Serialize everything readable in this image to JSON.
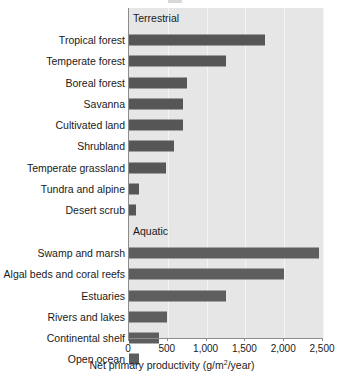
{
  "chart_data": {
    "type": "bar",
    "orientation": "horizontal",
    "title": "",
    "xlabel": "Net primary productivity (g/m2/year)",
    "xlabel_parts": {
      "before": "Net primary productivity (g/m",
      "superscript": "2",
      "after": "/year)"
    },
    "ylabel": "",
    "xlim": [
      0,
      2500
    ],
    "xticks": [
      0,
      500,
      1000,
      1500,
      2000,
      2500
    ],
    "xtick_labels": [
      "0",
      "500",
      "1,000",
      "1,500",
      "2,000",
      "2,500"
    ],
    "grid": true,
    "grid_axis": "x",
    "legend": "none",
    "group_labels": [
      "Terrestrial",
      "Aquatic"
    ],
    "categories": [
      "Tropical forest",
      "Temperate forest",
      "Boreal forest",
      "Savanna",
      "Cultivated land",
      "Shrubland",
      "Temperate grassland",
      "Tundra and alpine",
      "Desert scrub",
      "Swamp and marsh",
      "Algal beds and coral reefs",
      "Estuaries",
      "Rivers and lakes",
      "Continental shelf",
      "Open ocean"
    ],
    "values": [
      1750,
      1250,
      750,
      700,
      700,
      580,
      480,
      130,
      90,
      2450,
      2000,
      1250,
      490,
      390,
      125
    ],
    "groups": [
      "Terrestrial",
      "Terrestrial",
      "Terrestrial",
      "Terrestrial",
      "Terrestrial",
      "Terrestrial",
      "Terrestrial",
      "Terrestrial",
      "Terrestrial",
      "Aquatic",
      "Aquatic",
      "Aquatic",
      "Aquatic",
      "Aquatic",
      "Aquatic"
    ],
    "series": [
      {
        "name": "Net primary productivity",
        "values": [
          1750,
          1250,
          750,
          700,
          700,
          580,
          480,
          130,
          90,
          2450,
          2000,
          1250,
          490,
          390,
          125
        ]
      }
    ],
    "colors": {
      "bar": "#565656",
      "bar_aquatic": "#5e5e5e",
      "plot_background": "#e6e6e6",
      "gridline": "#f4f4f4",
      "axis": "#8c8c8c",
      "text": "#1a1a1a",
      "page_background": "#ffffff"
    }
  }
}
